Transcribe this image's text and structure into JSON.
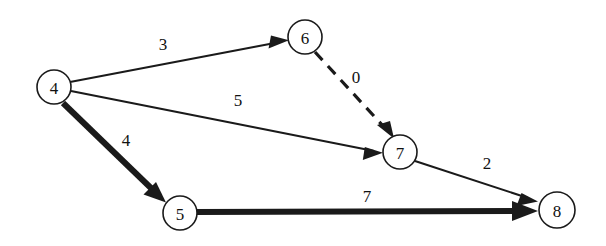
{
  "figure": {
    "type": "directed-weighted-graph",
    "background_color": "#ffffff",
    "stroke_color": "#1a1a1a",
    "text_color": "#111111"
  },
  "nodes": [
    {
      "id": "4",
      "label": "4",
      "cx": 54,
      "cy": 87,
      "r": 17
    },
    {
      "id": "6",
      "label": "6",
      "cx": 305,
      "cy": 37,
      "r": 17
    },
    {
      "id": "5",
      "label": "5",
      "cx": 180,
      "cy": 213,
      "r": 17
    },
    {
      "id": "7",
      "label": "7",
      "cx": 400,
      "cy": 152,
      "r": 17
    },
    {
      "id": "8",
      "label": "8",
      "cx": 557,
      "cy": 210,
      "r": 18
    }
  ],
  "edges": [
    {
      "id": "edge-4-6",
      "from": "4",
      "to": "6",
      "weight": "3",
      "style": "solid",
      "thickness": "thin",
      "label_x": 163,
      "label_y": 44
    },
    {
      "id": "edge-4-7",
      "from": "4",
      "to": "7",
      "weight": "5",
      "style": "solid",
      "thickness": "thin",
      "label_x": 238,
      "label_y": 100
    },
    {
      "id": "edge-4-5",
      "from": "4",
      "to": "5",
      "weight": "4",
      "style": "solid",
      "thickness": "thick",
      "label_x": 126,
      "label_y": 140
    },
    {
      "id": "edge-6-7",
      "from": "6",
      "to": "7",
      "weight": "0",
      "style": "dashed",
      "thickness": "dashed",
      "label_x": 356,
      "label_y": 77
    },
    {
      "id": "edge-7-8",
      "from": "7",
      "to": "8",
      "weight": "2",
      "style": "solid",
      "thickness": "thin",
      "label_x": 487,
      "label_y": 163
    },
    {
      "id": "edge-5-8",
      "from": "5",
      "to": "8",
      "weight": "7",
      "style": "solid",
      "thickness": "thick",
      "label_x": 367,
      "label_y": 196
    }
  ]
}
